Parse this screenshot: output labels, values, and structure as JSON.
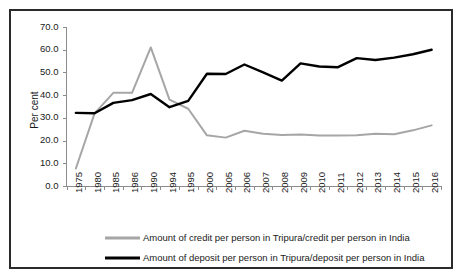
{
  "chart_data": {
    "type": "line",
    "title": "",
    "xlabel": "",
    "ylabel": "Per cent",
    "ylim": [
      0,
      70
    ],
    "ytick_step": 10,
    "ytick_labels": [
      "0.0",
      "10.0",
      "20.0",
      "30.0",
      "40.0",
      "50.0",
      "60.0",
      "70.0"
    ],
    "grid": false,
    "legend_position": "bottom",
    "categories": [
      "1975",
      "1980",
      "1985",
      "1986",
      "1990",
      "1994",
      "1995",
      "2000",
      "2005",
      "2006",
      "2007",
      "2008",
      "2009",
      "2010",
      "2011",
      "2012",
      "2013",
      "2014",
      "2015",
      "2016"
    ],
    "series": [
      {
        "name": "Amount of credit per person in Tripura/credit per person in India",
        "color": "#a6a6a6",
        "values": [
          7.7,
          32.0,
          41.0,
          41.0,
          61.0,
          38.0,
          34.0,
          22.3,
          21.3,
          24.3,
          23.0,
          22.5,
          22.7,
          22.2,
          22.2,
          22.3,
          23.0,
          22.8,
          24.5,
          26.7
        ]
      },
      {
        "name": "Amount of deposit per person in Tripura/deposit per person in India",
        "color": "#000000",
        "values": [
          32.2,
          32.0,
          36.6,
          37.8,
          40.5,
          34.7,
          37.5,
          49.4,
          49.3,
          53.5,
          50.0,
          46.4,
          54.0,
          52.6,
          52.3,
          56.3,
          55.5,
          56.5,
          58.0,
          60.0
        ]
      }
    ]
  },
  "axis": {
    "y_title": "Per cent"
  },
  "legend": {
    "items": [
      {
        "label": "Amount of credit per person in Tripura/credit per person in India",
        "color": "#a6a6a6"
      },
      {
        "label": "Amount of deposit per person in Tripura/deposit per person in India",
        "color": "#000000"
      }
    ]
  },
  "colors": {
    "credit": "#a6a6a6",
    "deposit": "#000000",
    "axis": "#8c8c8c",
    "frame": "#2b2b2b",
    "background": "#ffffff"
  }
}
